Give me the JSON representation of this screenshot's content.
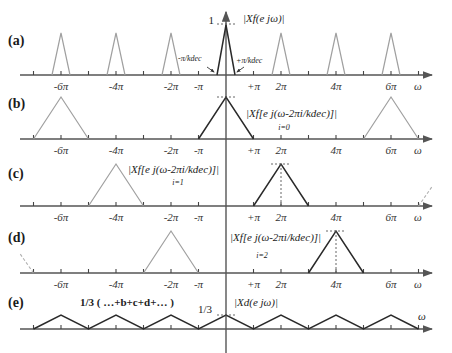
{
  "figure": {
    "panels": [
      {
        "id": "a",
        "label": "(a)",
        "axis_y": 75,
        "label_y": 45
      },
      {
        "id": "b",
        "label": "(b)",
        "axis_y": 139,
        "label_y": 108
      },
      {
        "id": "c",
        "label": "(c)",
        "axis_y": 206,
        "label_y": 178
      },
      {
        "id": "d",
        "label": "(d)",
        "axis_y": 273,
        "label_y": 242
      },
      {
        "id": "e",
        "label": "(e)",
        "axis_y": 329,
        "label_y": 307
      }
    ],
    "tick_labels": {
      "m6pi": "-6π",
      "m4pi": "-4π",
      "m2pi": "-2π",
      "mpi": "-π",
      "ppi": "+π",
      "p2pi": "2π",
      "p4pi": "4π",
      "p6pi": "6π",
      "omega": "ω"
    },
    "annotations": {
      "a_peak_value": "1",
      "a_spectrum": "|Xf(e jω)|",
      "a_left_edge": "-π/kdec",
      "a_right_edge": "+π/kdec",
      "b_spectrum": "|Xf[e j(ω-2πi/kdec)]|",
      "b_index": "i=0",
      "c_spectrum": "|Xf[e j(ω-2πi/kdec)]|",
      "c_index": "i=1",
      "d_spectrum": "|Xf[e j(ω-2πi/kdec)]|",
      "d_index": "i=2",
      "e_sum": "1/3 ( …+b+c+d+… )",
      "e_peak_value": "1/3",
      "e_spectrum": "|Xd(e jω)|",
      "e_omega": "ω"
    }
  },
  "chart_data": {
    "type": "line",
    "xlabel": "ω",
    "x_ticks": [
      "-6π",
      "-4π",
      "-2π",
      "-π",
      "+π",
      "2π",
      "4π",
      "6π"
    ],
    "panels": [
      {
        "label": "(a)",
        "description": "|Xf(e^jω)| periodic triangles of height 1, width ±π/kdec, centered at 0, ±2π, ±4π, ±6π",
        "centers_pi": [
          -6,
          -4,
          -2,
          0,
          2,
          4,
          6
        ],
        "half_width_pi": 0.333,
        "height": 1
      },
      {
        "label": "(b)",
        "description": "i=0 shifted spectrum, triangles of half-width π centered at 0, ±6π",
        "centers_pi": [
          -6,
          0,
          6
        ],
        "half_width_pi": 1,
        "height": 1
      },
      {
        "label": "(c)",
        "description": "i=1 shifted spectrum, centered at -4π, 2π",
        "centers_pi": [
          -4,
          2,
          8
        ],
        "half_width_pi": 1,
        "height": 1
      },
      {
        "label": "(d)",
        "description": "i=2 shifted spectrum, centered at -8π, -2π, 4π",
        "centers_pi": [
          -8,
          -2,
          4
        ],
        "half_width_pi": 1,
        "height": 1
      },
      {
        "label": "(e)",
        "description": "|Xd(e^jω)| = 1/3(...+b+c+d+...), continuous triangle wave of peak 1/3",
        "centers_pi": [
          -6,
          -4,
          -2,
          0,
          2,
          4,
          6
        ],
        "half_width_pi": 1,
        "height": 0.333
      }
    ]
  }
}
